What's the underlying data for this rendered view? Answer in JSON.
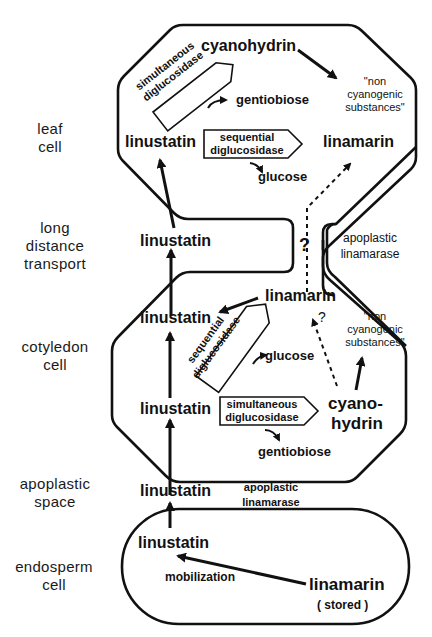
{
  "row_labels": {
    "leaf_cell": [
      "leaf",
      "cell"
    ],
    "long_distance": [
      "long",
      "distance",
      "transport"
    ],
    "cotyledon_cell": [
      "cotyledon",
      "cell"
    ],
    "apoplastic_space": [
      "apoplastic",
      "space"
    ],
    "endosperm_cell": [
      "endosperm",
      "cell"
    ]
  },
  "leaf": {
    "cyanohydrin": "cyanohydrin",
    "non_cyanogenic": [
      "\"non",
      "cyanogenic",
      "substances\""
    ],
    "simultaneous_enzyme": [
      "simultaneous",
      "diglucosidase"
    ],
    "gentiobiose": "gentiobiose",
    "linustatin": "linustatin",
    "sequential_enzyme": [
      "sequential",
      "diglucosidase"
    ],
    "glucose": "glucose",
    "linamarin": "linamarin"
  },
  "transport": {
    "linustatin": "linustatin",
    "question": "?",
    "apoplastic_linamarase": [
      "apoplastic",
      "linamarase"
    ]
  },
  "cotyledon": {
    "linamarin": "linamarin",
    "linustatin_top": "linustatin",
    "question": "?",
    "non_cyanogenic": [
      "\"non",
      "cyanogenic",
      "substances\""
    ],
    "sequential_enzyme": [
      "sequential",
      "diglucosidase"
    ],
    "glucose": "glucose",
    "linustatin_bottom": "linustatin",
    "simultaneous_enzyme": [
      "simultaneous",
      "diglucosidase"
    ],
    "cyanohydrin": [
      "cyano-",
      "hydrin"
    ],
    "gentiobiose": "gentiobiose"
  },
  "apoplast": {
    "linustatin": "linustatin",
    "apoplastic_linamarase": [
      "apoplastic",
      "linamarase"
    ]
  },
  "endosperm": {
    "linustatin": "linustatin",
    "mobilization": "mobilization",
    "linamarin": "linamarin",
    "stored": "( stored )"
  }
}
